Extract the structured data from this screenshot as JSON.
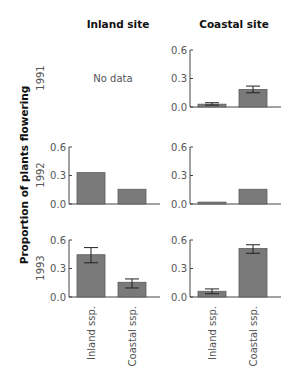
{
  "chart_data": {
    "type": "bar",
    "title": "",
    "ylabel": "Proportion of plants flowering",
    "xlabel": "",
    "columns": [
      "Inland site",
      "Coastal site"
    ],
    "rows": [
      "1991",
      "1992",
      "1993"
    ],
    "categories": [
      "Inland ssp.",
      "Coastal ssp."
    ],
    "ylim": [
      0,
      0.6
    ],
    "yticks": [
      "0.0",
      "0.3",
      "0.6"
    ],
    "grid": false,
    "no_data_label": "No data",
    "bar_color": "#7a7a7a",
    "panels": [
      {
        "site": "Inland site",
        "year": "1991",
        "no_data": true,
        "values": [],
        "err_low": [],
        "err_high": []
      },
      {
        "site": "Coastal site",
        "year": "1991",
        "no_data": false,
        "values": [
          0.03,
          0.185
        ],
        "err_low": [
          0.02,
          0.15
        ],
        "err_high": [
          0.045,
          0.22
        ]
      },
      {
        "site": "Inland site",
        "year": "1992",
        "no_data": false,
        "values": [
          0.33,
          0.155
        ],
        "err_low": [
          null,
          null
        ],
        "err_high": [
          null,
          null
        ]
      },
      {
        "site": "Coastal site",
        "year": "1992",
        "no_data": false,
        "values": [
          0.02,
          0.155
        ],
        "err_low": [
          null,
          null
        ],
        "err_high": [
          null,
          null
        ]
      },
      {
        "site": "Inland site",
        "year": "1993",
        "no_data": false,
        "values": [
          0.445,
          0.155
        ],
        "err_low": [
          0.36,
          0.095
        ],
        "err_high": [
          0.52,
          0.19
        ]
      },
      {
        "site": "Coastal site",
        "year": "1993",
        "no_data": false,
        "values": [
          0.06,
          0.51
        ],
        "err_low": [
          0.035,
          0.46
        ],
        "err_high": [
          0.085,
          0.55
        ]
      }
    ]
  }
}
